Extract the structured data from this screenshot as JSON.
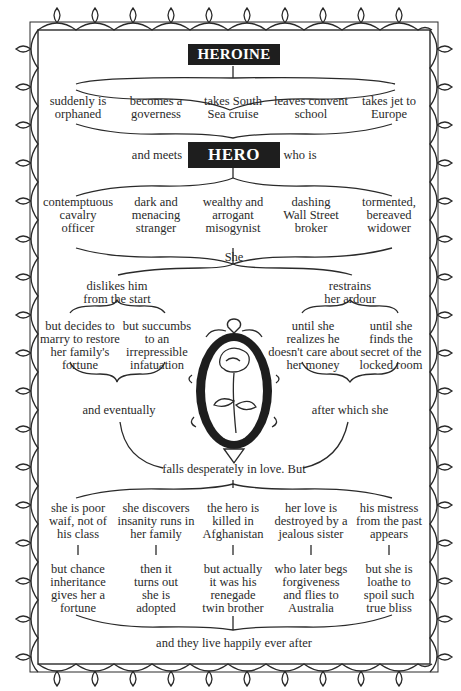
{
  "title": "HEROINE",
  "heroine_options": [
    "suddenly is\norphaned",
    "becomes a\ngoverness",
    "takes South\nSea cruise",
    "leaves convent\nschool",
    "takes jet to\nEurope"
  ],
  "meets": {
    "before": "and meets",
    "hero_label": "HERO",
    "after": "who is"
  },
  "hero_options": [
    "contemptuous\ncavalry\nofficer",
    "dark and\nmenacing\nstranger",
    "wealthy and\narrogant\nmisogynist",
    "dashing\nWall Street\nbroker",
    "tormented,\nbereaved\nwidower"
  ],
  "she": "She",
  "left_branch": {
    "label": "dislikes him\nfrom the start",
    "options": [
      "but decides to\nmarry to restore\nher family's\nfortune",
      "but succumbs\nto an\nirrepressible\ninfatuation"
    ],
    "join": "and eventually"
  },
  "right_branch": {
    "label": "restrains\nher ardour",
    "options": [
      "until she\nrealizes he\ndoesn't care about\nher money",
      "until she\nfinds the\nsecret of the\nlocked room"
    ],
    "join": "after which she"
  },
  "falls": "falls desperately in love. But",
  "obstacles": [
    {
      "problem": "she is poor\nwaif, not of\nhis class",
      "resolution": "but chance\ninheritance\ngives her a\nfortune"
    },
    {
      "problem": "she discovers\ninsanity runs in\nher family",
      "resolution": "then it\nturns out\nshe is\nadopted"
    },
    {
      "problem": "the hero is\nkilled in\nAfghanistan",
      "resolution": "but actually\nit was his\nrenegade\ntwin brother"
    },
    {
      "problem": "her love is\ndestroyed by a\njealous sister",
      "resolution": "who later begs\nforgiveness\nand flies to\nAustralia"
    },
    {
      "problem": "his mistress\nfrom the past\nappears",
      "resolution": "but she is\nloathe to\nspoil such\ntrue bliss"
    }
  ],
  "ending": "and they live happily ever after",
  "decoration": {
    "border": "ornamental-lace-border",
    "center_image": "rose-in-oval-frame-icon"
  },
  "colors": {
    "ink": "#2a2a2a",
    "box_fill": "#1e1e1e",
    "box_text": "#ffffff",
    "background": "#ffffff"
  }
}
